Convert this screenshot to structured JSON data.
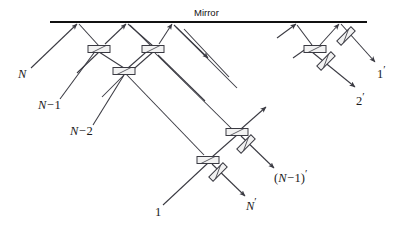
{
  "figure": {
    "title": "Mirror",
    "type": "optics-ray-diagram",
    "background": "#ffffff",
    "line_color": "#3a3a42",
    "mirror_color": "#111111",
    "splitter_fill": "#f2f2f2",
    "splitter_stroke": "#3a3a42",
    "width": 402,
    "height": 232
  },
  "mirror": {
    "label": "Mirror",
    "x1": 50,
    "x2": 367,
    "y": 22
  },
  "labels": {
    "input_n": "N",
    "input_n_minus_1_head": "N",
    "input_n_minus_1_op": "−",
    "input_n_minus_1_num": "1",
    "input_n_minus_2_head": "N",
    "input_n_minus_2_op": "−",
    "input_n_minus_2_num": "2",
    "input_1": "1",
    "output_1_base": "1",
    "output_2_base": "2",
    "output_n_base": "N",
    "output_n_minus_1_open": "(",
    "output_n_minus_1_head": "N",
    "output_n_minus_1_op": "−",
    "output_n_minus_1_num": "1",
    "output_n_minus_1_close": ")",
    "prime": "′"
  },
  "beam_splitters": [
    {
      "name": "bs-top-left",
      "x": 99,
      "y": 49,
      "angle": 0
    },
    {
      "name": "bs-top-mid",
      "x": 153,
      "y": 49,
      "angle": 0
    },
    {
      "name": "bs-second-row",
      "x": 124,
      "y": 71,
      "angle": 0
    },
    {
      "name": "bs-lower-right",
      "x": 237,
      "y": 132,
      "angle": 0
    },
    {
      "name": "bs-lower-left",
      "x": 208,
      "y": 160,
      "angle": 0
    },
    {
      "name": "bs-right-upper",
      "x": 315,
      "y": 49,
      "angle": 0
    }
  ],
  "mirror_plates": [
    {
      "name": "plate-lower-right",
      "x": 246,
      "y": 144,
      "angle": -45
    },
    {
      "name": "plate-lower-left",
      "x": 218,
      "y": 172,
      "angle": -45
    },
    {
      "name": "plate-right-a",
      "x": 345,
      "y": 36,
      "angle": -45
    },
    {
      "name": "plate-right-b",
      "x": 325,
      "y": 60,
      "angle": -45
    }
  ]
}
